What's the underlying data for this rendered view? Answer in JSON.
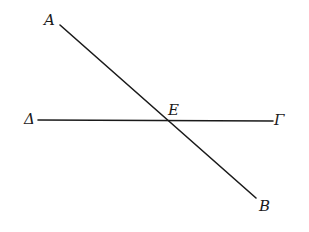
{
  "figure": {
    "width": 309,
    "height": 232,
    "background": "#ffffff",
    "stroke_color": "#1a1a1a",
    "points": [
      {
        "id": "A",
        "label": "A",
        "x": 60,
        "y": 25
      },
      {
        "id": "B",
        "label": "B",
        "x": 256,
        "y": 198
      },
      {
        "id": "Delta",
        "label": "Δ",
        "x": 38,
        "y": 120
      },
      {
        "id": "Gamma",
        "label": "Γ",
        "x": 273,
        "y": 121
      },
      {
        "id": "E",
        "label": "E",
        "x": 165,
        "y": 120
      }
    ],
    "segments": [
      {
        "name": "AB",
        "from": "A",
        "to": "B"
      },
      {
        "name": "ΔΓ",
        "from": "Delta",
        "to": "Gamma"
      }
    ],
    "intersection": {
      "label": "E",
      "lines": [
        "AB",
        "ΔΓ"
      ]
    }
  },
  "labels": {
    "A": "A",
    "B": "B",
    "Delta": "Δ",
    "Gamma": "Γ",
    "E": "E"
  }
}
